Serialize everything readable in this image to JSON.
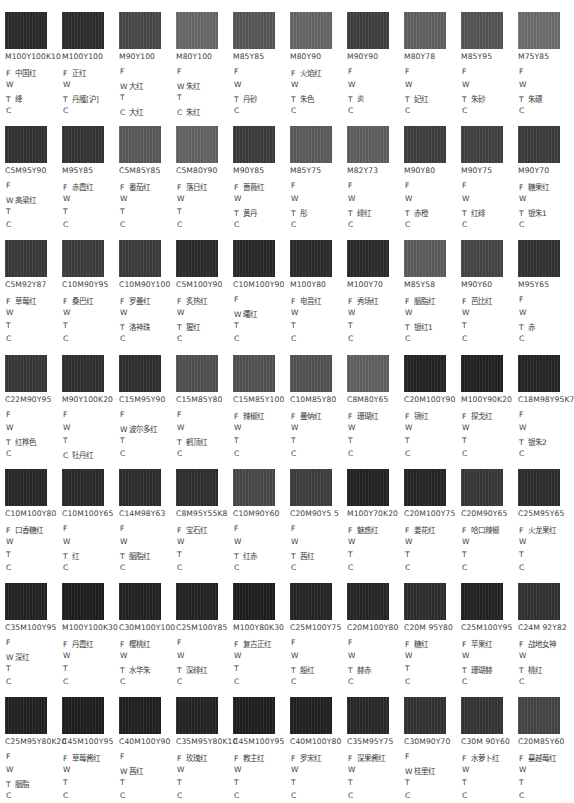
{
  "labels": {
    "f": "F",
    "w": "W",
    "t": "T",
    "c": "C"
  },
  "rows": [
    {
      "swatches": [
        {
          "code": "M100Y100K10",
          "gray": "#2c2c2c",
          "f": "中国红",
          "w": "",
          "t": "绛",
          "c": ""
        },
        {
          "code": "M100Y100",
          "gray": "#2e2e2e",
          "f": "正红",
          "w": "",
          "t": "丹雘[沪]",
          "c": ""
        },
        {
          "code": "M90Y100",
          "gray": "#4a4a4a",
          "f": "",
          "w": "大红",
          "t": "",
          "c": "大红"
        },
        {
          "code": "M80Y100",
          "gray": "#6d6d6d",
          "f": "",
          "w": "朱红",
          "t": "",
          "c": "朱红"
        },
        {
          "code": "M85Y85",
          "gray": "#5a5a5a",
          "f": "",
          "w": "",
          "t": "丹砂",
          "c": ""
        },
        {
          "code": "M80Y90",
          "gray": "#696969",
          "f": "火焰红",
          "w": "",
          "t": "朱色",
          "c": ""
        },
        {
          "code": "M90Y90",
          "gray": "#414141",
          "f": "",
          "w": "",
          "t": "炎",
          "c": ""
        },
        {
          "code": "M80Y78",
          "gray": "#646464",
          "f": "",
          "w": "",
          "t": "妃红",
          "c": ""
        },
        {
          "code": "M85Y95",
          "gray": "#575757",
          "f": "",
          "w": "",
          "t": "朱砂",
          "c": ""
        },
        {
          "code": "M75Y85",
          "gray": "#707070",
          "f": "",
          "w": "",
          "t": "朱磦",
          "c": ""
        }
      ]
    },
    {
      "swatches": [
        {
          "code": "C5M95Y90",
          "gray": "#333333",
          "f": "",
          "w": "高粱红",
          "t": "",
          "c": ""
        },
        {
          "code": "M95Y85",
          "gray": "#353535",
          "f": "赤霞红",
          "w": "",
          "t": "",
          "c": ""
        },
        {
          "code": "C5M85Y85",
          "gray": "#5c5c5c",
          "f": "番茄红",
          "w": "",
          "t": "",
          "c": ""
        },
        {
          "code": "C5M80Y90",
          "gray": "#666666",
          "f": "落日红",
          "w": "",
          "t": "",
          "c": ""
        },
        {
          "code": "M90Y85",
          "gray": "#3d3d3d",
          "f": "蔷薇红",
          "w": "",
          "t": "黄丹",
          "c": ""
        },
        {
          "code": "M85Y75",
          "gray": "#5e5e5e",
          "f": "",
          "w": "",
          "t": "彤",
          "c": ""
        },
        {
          "code": "M82Y73",
          "gray": "#636363",
          "f": "",
          "w": "",
          "t": "绯红",
          "c": ""
        },
        {
          "code": "M90Y80",
          "gray": "#404040",
          "f": "",
          "w": "",
          "t": "赤橙",
          "c": ""
        },
        {
          "code": "M90Y75",
          "gray": "#434343",
          "f": "",
          "w": "",
          "t": "红绯",
          "c": ""
        },
        {
          "code": "M90Y70",
          "gray": "#3e3e3e",
          "f": "糖果红",
          "w": "",
          "t": "银朱1",
          "c": ""
        }
      ]
    },
    {
      "swatches": [
        {
          "code": "C5M92Y87",
          "gray": "#3b3b3b",
          "f": "草莓红",
          "w": "",
          "t": "",
          "c": ""
        },
        {
          "code": "C10M90Y95",
          "gray": "#3f3f3f",
          "f": "桑巴红",
          "w": "",
          "t": "",
          "c": ""
        },
        {
          "code": "C10M90Y100",
          "gray": "#3d3d3d",
          "f": "罗曼红",
          "w": "",
          "t": "洛神珠",
          "c": ""
        },
        {
          "code": "C5M100Y90",
          "gray": "#2b2b2b",
          "f": "炙热红",
          "w": "",
          "t": "猩红",
          "c": ""
        },
        {
          "code": "C10M100Y90",
          "gray": "#2a2a2a",
          "f": "",
          "w": "曙红",
          "t": "",
          "c": ""
        },
        {
          "code": "M100Y80",
          "gray": "#2d2d2d",
          "f": "电音红",
          "w": "",
          "t": "",
          "c": ""
        },
        {
          "code": "M100Y70",
          "gray": "#2c2c2c",
          "f": "秀场红",
          "w": "",
          "t": "",
          "c": ""
        },
        {
          "code": "M85Y58",
          "gray": "#5f5f5f",
          "f": "胭脂红",
          "w": "",
          "t": "银红1",
          "c": ""
        },
        {
          "code": "M90Y60",
          "gray": "#474747",
          "f": "芭比红",
          "w": "",
          "t": "",
          "c": ""
        },
        {
          "code": "M95Y65",
          "gray": "#333333",
          "f": "",
          "w": "",
          "t": "赤",
          "c": ""
        }
      ]
    },
    {
      "swatches": [
        {
          "code": "C22M90Y95",
          "gray": "#3a3a3a",
          "f": "",
          "w": "",
          "t": "红桦色",
          "c": ""
        },
        {
          "code": "M90Y100K20",
          "gray": "#323232",
          "f": "",
          "w": "",
          "t": "",
          "c": "牡丹红"
        },
        {
          "code": "C15M95Y90",
          "gray": "#303030",
          "f": "",
          "w": "波尔多红",
          "t": "",
          "c": ""
        },
        {
          "code": "C15M85Y80",
          "gray": "#525252",
          "f": "",
          "w": "",
          "t": "鹤顶红",
          "c": ""
        },
        {
          "code": "C15M85Y100",
          "gray": "#545454",
          "f": "辣椒红",
          "w": "",
          "t": "",
          "c": ""
        },
        {
          "code": "C10M85Y80",
          "gray": "#565656",
          "f": "曼纳红",
          "w": "",
          "t": "",
          "c": ""
        },
        {
          "code": "C8M80Y65",
          "gray": "#646464",
          "f": "珊瑚红",
          "w": "",
          "t": "",
          "c": ""
        },
        {
          "code": "C20M100Y90",
          "gray": "#252525",
          "f": "锦红",
          "w": "",
          "t": "",
          "c": ""
        },
        {
          "code": "M100Y90K20",
          "gray": "#232323",
          "f": "探戈红",
          "w": "",
          "t": "",
          "c": ""
        },
        {
          "code": "C18M98Y95K7",
          "gray": "#262626",
          "f": "",
          "w": "",
          "t": "银朱2",
          "c": ""
        }
      ]
    },
    {
      "swatches": [
        {
          "code": "C10M100Y80",
          "gray": "#292929",
          "f": "口香糖红",
          "w": "",
          "t": "",
          "c": ""
        },
        {
          "code": "C10M100Y65",
          "gray": "#2b2b2b",
          "f": "",
          "w": "",
          "t": "红",
          "c": ""
        },
        {
          "code": "C14M98Y63",
          "gray": "#2e2e2e",
          "f": "",
          "w": "",
          "t": "胭脂红",
          "c": ""
        },
        {
          "code": "C8M95Y55K8",
          "gray": "#303030",
          "f": "宝石红",
          "w": "",
          "t": "",
          "c": ""
        },
        {
          "code": "C10M90Y60",
          "gray": "#4b4b4b",
          "f": "",
          "w": "",
          "t": "红赤",
          "c": ""
        },
        {
          "code": "C20M90Y5 5",
          "gray": "#404040",
          "f": "",
          "w": "",
          "t": "茜红",
          "c": ""
        },
        {
          "code": "M100Y70K20",
          "gray": "#242424",
          "f": "魅惑红",
          "w": "",
          "t": "",
          "c": ""
        },
        {
          "code": "C20M100Y75",
          "gray": "#262626",
          "f": "姜花红",
          "w": "",
          "t": "",
          "c": ""
        },
        {
          "code": "C20M90Y65",
          "gray": "#3a3a3a",
          "f": "哈口辣椒",
          "w": "",
          "t": "",
          "c": ""
        },
        {
          "code": "C25M95Y65",
          "gray": "#2e2e2e",
          "f": "火龙果红",
          "w": "",
          "t": "",
          "c": ""
        }
      ]
    },
    {
      "swatches": [
        {
          "code": "C35M100Y95",
          "gray": "#242424",
          "f": "",
          "w": "深红",
          "t": "",
          "c": ""
        },
        {
          "code": "M100Y100K30",
          "gray": "#1f1f1f",
          "f": "丹霞红",
          "w": "",
          "t": "",
          "c": ""
        },
        {
          "code": "C30M100Y100",
          "gray": "#232323",
          "f": "樱桃红",
          "w": "",
          "t": "水华朱",
          "c": ""
        },
        {
          "code": "C25M100Y85",
          "gray": "#252525",
          "f": "",
          "w": "",
          "t": "深绯红",
          "c": ""
        },
        {
          "code": "M100Y80K30",
          "gray": "#1e1e1e",
          "f": "复古正红",
          "w": "",
          "t": "",
          "c": ""
        },
        {
          "code": "C25M100Y75",
          "gray": "#262626",
          "f": "",
          "w": "",
          "t": "殷红",
          "c": ""
        },
        {
          "code": "C20M100Y80",
          "gray": "#272727",
          "f": "",
          "w": "",
          "t": "赫赤",
          "c": ""
        },
        {
          "code": "C20M 95Y80",
          "gray": "#2f2f2f",
          "f": "糖红",
          "w": "",
          "t": "",
          "c": ""
        },
        {
          "code": "C25M100Y95",
          "gray": "#242424",
          "f": "苹果红",
          "w": "",
          "t": "珊瑚赫",
          "c": ""
        },
        {
          "code": "C24M 92Y82",
          "gray": "#333333",
          "f": "战地女神",
          "w": "",
          "t": "桃红",
          "c": ""
        }
      ]
    },
    {
      "swatches": [
        {
          "code": "C25M95Y80K20",
          "gray": "#222222",
          "f": "",
          "w": "",
          "t": "胭脂",
          "c": ""
        },
        {
          "code": "C45M100Y95",
          "gray": "#1f1f1f",
          "f": "草莓酱红",
          "w": "",
          "t": "",
          "c": ""
        },
        {
          "code": "C40M100Y90",
          "gray": "#212121",
          "f": "",
          "w": "茜红",
          "t": "",
          "c": ""
        },
        {
          "code": "C35M95Y80K10",
          "gray": "#252525",
          "f": "玫瑰红",
          "w": "",
          "t": "",
          "c": ""
        },
        {
          "code": "C45M100Y95",
          "gray": "#202020",
          "f": "教主红",
          "w": "",
          "t": "",
          "c": ""
        },
        {
          "code": "C40M100Y80",
          "gray": "#222222",
          "f": "罗宋红",
          "w": "",
          "t": "",
          "c": ""
        },
        {
          "code": "C35M95Y75",
          "gray": "#2a2a2a",
          "f": "深果酱红",
          "w": "",
          "t": "",
          "c": ""
        },
        {
          "code": "C30M90Y70",
          "gray": "#343434",
          "f": "",
          "w": "桂里红",
          "t": "",
          "c": ""
        },
        {
          "code": "C30M 90Y60",
          "gray": "#363636",
          "f": "水萝卜红",
          "w": "",
          "t": "",
          "c": ""
        },
        {
          "code": "C20M85Y60",
          "gray": "#474747",
          "f": "蔓越莓红",
          "w": "",
          "t": "",
          "c": ""
        }
      ]
    }
  ]
}
